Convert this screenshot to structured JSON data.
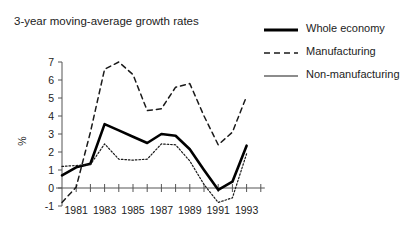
{
  "chart_data": {
    "type": "line",
    "title": "3-year moving-average growth rates",
    "xlabel": "",
    "ylabel": "%",
    "xlim": [
      1980,
      1994
    ],
    "ylim": [
      -1,
      7
    ],
    "grid": false,
    "legend_position": "top-right",
    "x": [
      1980,
      1981,
      1982,
      1983,
      1984,
      1985,
      1986,
      1987,
      1988,
      1989,
      1990,
      1991,
      1992,
      1993
    ],
    "x_tick_labels": [
      "1981",
      "1983",
      "1985",
      "1987",
      "1989",
      "1991",
      "1993"
    ],
    "x_tick_values": [
      1981,
      1983,
      1985,
      1987,
      1989,
      1991,
      1993
    ],
    "y_tick_labels": [
      "-1",
      "0",
      "1",
      "2",
      "3",
      "4",
      "5",
      "6",
      "7"
    ],
    "y_tick_values": [
      -1,
      0,
      1,
      2,
      3,
      4,
      5,
      6,
      7
    ],
    "series": [
      {
        "name": "Whole economy",
        "style": "solid-thick",
        "color": "#000000",
        "values": [
          0.7,
          1.15,
          1.35,
          3.55,
          3.2,
          2.85,
          2.5,
          3.0,
          2.9,
          2.15,
          1.0,
          -0.1,
          0.35,
          2.35
        ]
      },
      {
        "name": "Manufacturing",
        "style": "dashed",
        "color": "#1a1a1a",
        "values": [
          -0.8,
          0.05,
          3.1,
          6.6,
          7.0,
          6.3,
          4.3,
          4.4,
          5.6,
          5.8,
          4.0,
          2.4,
          3.1,
          5.1
        ]
      },
      {
        "name": "Non-manufacturing",
        "style": "dotted",
        "color": "#1a1a1a",
        "values": [
          1.2,
          1.25,
          1.3,
          2.45,
          1.6,
          1.55,
          1.6,
          2.45,
          2.4,
          1.5,
          0.2,
          -0.8,
          -0.55,
          1.9
        ]
      }
    ]
  },
  "legend": {
    "items": [
      {
        "label": "Whole economy",
        "style": "solid-thick"
      },
      {
        "label": "Manufacturing",
        "style": "dashed"
      },
      {
        "label": "Non-manufacturing",
        "style": "dotted"
      }
    ]
  }
}
